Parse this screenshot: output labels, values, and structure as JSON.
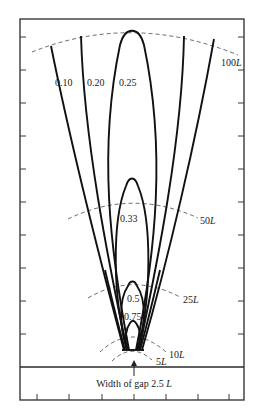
{
  "figure": {
    "caption": "Width of gap 2.5 ",
    "caption_unit": "L",
    "lobe_labels": [
      {
        "id": "0.10",
        "text": "0.10",
        "x": 55,
        "y": 86
      },
      {
        "id": "0.20",
        "text": "0.20",
        "x": 87,
        "y": 86
      },
      {
        "id": "0.25",
        "text": "0.25",
        "x": 119,
        "y": 86
      },
      {
        "id": "0.33",
        "text": "0.33",
        "x": 120,
        "y": 222
      },
      {
        "id": "0.5",
        "text": "0.5",
        "x": 127,
        "y": 302
      },
      {
        "id": "0.75",
        "text": "0.75",
        "x": 124,
        "y": 320
      }
    ],
    "distance_labels": [
      {
        "id": "100L",
        "num": "100",
        "unit": "L",
        "x": 221,
        "y": 66
      },
      {
        "id": "50L",
        "num": "50",
        "unit": "L",
        "x": 200,
        "y": 224
      },
      {
        "id": "25L",
        "num": "25",
        "unit": "L",
        "x": 183,
        "y": 303
      },
      {
        "id": "10L",
        "num": "10",
        "unit": "L",
        "x": 169,
        "y": 358
      },
      {
        "id": "5L",
        "num": "5",
        "unit": "L",
        "x": 156,
        "y": 365
      }
    ],
    "colors": {
      "ink": "#111111",
      "dash": "#444444",
      "background": "#ffffff"
    }
  }
}
